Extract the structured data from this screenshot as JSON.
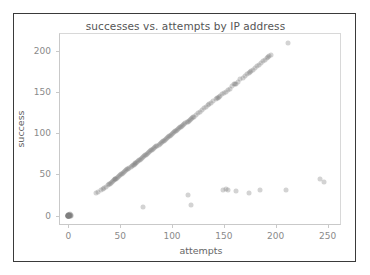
{
  "figure": {
    "background_color": "#ffffff",
    "frame_color": "#3a3a3a"
  },
  "chart_data": {
    "type": "scatter",
    "title": "successes vs. attempts by IP address",
    "xlabel": "attempts",
    "ylabel": "success",
    "xlim": [
      -8,
      262
    ],
    "ylim": [
      -10,
      220
    ],
    "xticks": [
      0,
      50,
      100,
      150,
      200,
      250
    ],
    "yticks": [
      0,
      50,
      100,
      150,
      200
    ],
    "xtick_labels": [
      "0",
      "50",
      "100",
      "150",
      "200",
      "250"
    ],
    "ytick_labels": [
      "0",
      "50",
      "100",
      "150",
      "200"
    ],
    "grid": false,
    "legend": null,
    "marker_color": "#808080",
    "marker_alpha": 0.35,
    "series": [
      {
        "name": "IP addresses",
        "points": [
          [
            0,
            0
          ],
          [
            0,
            0
          ],
          [
            0,
            0
          ],
          [
            1,
            0
          ],
          [
            1,
            1
          ],
          [
            0,
            1
          ],
          [
            2,
            0
          ],
          [
            1,
            0
          ],
          [
            0,
            0
          ],
          [
            2,
            1
          ],
          [
            0,
            0
          ],
          [
            1,
            1
          ],
          [
            3,
            0
          ],
          [
            0,
            1
          ],
          [
            1,
            0
          ],
          [
            2,
            2
          ],
          [
            0,
            0
          ],
          [
            1,
            0
          ],
          [
            0,
            1
          ],
          [
            2,
            0
          ],
          [
            3,
            1
          ],
          [
            0,
            0
          ],
          [
            1,
            1
          ],
          [
            0,
            0
          ],
          [
            27,
            27
          ],
          [
            29,
            29
          ],
          [
            32,
            31
          ],
          [
            33,
            32
          ],
          [
            34,
            33
          ],
          [
            36,
            35
          ],
          [
            38,
            37
          ],
          [
            39,
            38
          ],
          [
            40,
            39
          ],
          [
            41,
            40
          ],
          [
            42,
            41
          ],
          [
            43,
            42
          ],
          [
            44,
            43
          ],
          [
            45,
            44
          ],
          [
            45,
            45
          ],
          [
            46,
            45
          ],
          [
            47,
            46
          ],
          [
            48,
            47
          ],
          [
            49,
            48
          ],
          [
            50,
            49
          ],
          [
            51,
            50
          ],
          [
            52,
            51
          ],
          [
            53,
            52
          ],
          [
            54,
            53
          ],
          [
            55,
            54
          ],
          [
            56,
            55
          ],
          [
            57,
            56
          ],
          [
            58,
            57
          ],
          [
            59,
            58
          ],
          [
            60,
            59
          ],
          [
            61,
            60
          ],
          [
            62,
            61
          ],
          [
            63,
            62
          ],
          [
            64,
            63
          ],
          [
            64,
            64
          ],
          [
            65,
            64
          ],
          [
            66,
            65
          ],
          [
            67,
            66
          ],
          [
            68,
            67
          ],
          [
            69,
            68
          ],
          [
            70,
            69
          ],
          [
            71,
            70
          ],
          [
            72,
            71
          ],
          [
            73,
            72
          ],
          [
            74,
            73
          ],
          [
            75,
            74
          ],
          [
            76,
            75
          ],
          [
            77,
            76
          ],
          [
            78,
            77
          ],
          [
            79,
            78
          ],
          [
            80,
            79
          ],
          [
            81,
            80
          ],
          [
            82,
            81
          ],
          [
            83,
            82
          ],
          [
            84,
            83
          ],
          [
            85,
            84
          ],
          [
            86,
            85
          ],
          [
            87,
            86
          ],
          [
            88,
            87
          ],
          [
            89,
            88
          ],
          [
            90,
            89
          ],
          [
            91,
            90
          ],
          [
            92,
            91
          ],
          [
            93,
            92
          ],
          [
            94,
            93
          ],
          [
            95,
            94
          ],
          [
            96,
            95
          ],
          [
            97,
            96
          ],
          [
            98,
            97
          ],
          [
            99,
            98
          ],
          [
            100,
            99
          ],
          [
            101,
            100
          ],
          [
            102,
            101
          ],
          [
            103,
            102
          ],
          [
            104,
            103
          ],
          [
            105,
            104
          ],
          [
            106,
            105
          ],
          [
            107,
            106
          ],
          [
            108,
            107
          ],
          [
            109,
            107
          ],
          [
            110,
            109
          ],
          [
            111,
            110
          ],
          [
            112,
            111
          ],
          [
            113,
            112
          ],
          [
            114,
            113
          ],
          [
            115,
            114
          ],
          [
            116,
            115
          ],
          [
            117,
            116
          ],
          [
            118,
            117
          ],
          [
            119,
            118
          ],
          [
            120,
            119
          ],
          [
            121,
            120
          ],
          [
            123,
            122
          ],
          [
            125,
            124
          ],
          [
            127,
            126
          ],
          [
            129,
            128
          ],
          [
            131,
            130
          ],
          [
            133,
            132
          ],
          [
            135,
            134
          ],
          [
            136,
            135
          ],
          [
            138,
            137
          ],
          [
            140,
            139
          ],
          [
            142,
            141
          ],
          [
            143,
            142
          ],
          [
            144,
            143
          ],
          [
            145,
            144
          ],
          [
            146,
            145
          ],
          [
            148,
            147
          ],
          [
            150,
            148
          ],
          [
            152,
            150
          ],
          [
            154,
            152
          ],
          [
            156,
            154
          ],
          [
            158,
            157
          ],
          [
            160,
            159
          ],
          [
            161,
            160
          ],
          [
            162,
            160
          ],
          [
            164,
            162
          ],
          [
            166,
            165
          ],
          [
            168,
            167
          ],
          [
            170,
            169
          ],
          [
            172,
            171
          ],
          [
            174,
            173
          ],
          [
            175,
            174
          ],
          [
            176,
            175
          ],
          [
            178,
            177
          ],
          [
            180,
            179
          ],
          [
            182,
            181
          ],
          [
            184,
            183
          ],
          [
            186,
            185
          ],
          [
            188,
            187
          ],
          [
            190,
            189
          ],
          [
            192,
            191
          ],
          [
            193,
            192
          ],
          [
            194,
            193
          ],
          [
            195,
            194
          ],
          [
            212,
            209
          ],
          [
            72,
            10
          ],
          [
            118,
            13
          ],
          [
            115,
            25
          ],
          [
            149,
            31
          ],
          [
            152,
            32
          ],
          [
            154,
            31
          ],
          [
            162,
            30
          ],
          [
            174,
            27
          ],
          [
            185,
            31
          ],
          [
            210,
            31
          ],
          [
            243,
            44
          ],
          [
            247,
            41
          ]
        ]
      }
    ]
  }
}
